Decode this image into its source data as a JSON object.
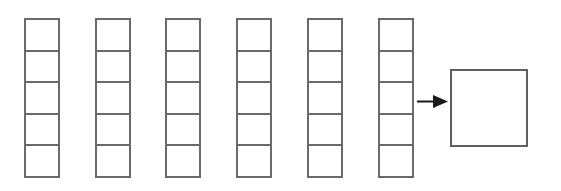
{
  "diagram": {
    "background_color": "#ffffff",
    "stroke_color": "#6a6a6a",
    "stroke_width": 2,
    "canvas": {
      "width": 561,
      "height": 191
    },
    "columns": {
      "count": 6,
      "cells_per_column": 5,
      "cell_width": 36,
      "cell_height": 33.6,
      "top": 18,
      "bottom": 186,
      "left_positions": [
        24,
        95,
        165,
        236,
        307,
        378
      ],
      "labels": [
        "",
        "",
        "",
        "",
        ""
      ]
    },
    "arrow": {
      "name": "rightwards-arrow",
      "glyph": "→",
      "color": "#1a1a1a",
      "x_start": 417,
      "x_end": 448,
      "y": 101,
      "line_width": 2,
      "head_width": 15,
      "head_height": 13
    },
    "result": {
      "name": "result-square",
      "label": "",
      "x": 450,
      "y": 69,
      "width": 78,
      "height": 78,
      "stroke_color": "#5f5f5f",
      "fill_color": "#ffffff"
    }
  }
}
